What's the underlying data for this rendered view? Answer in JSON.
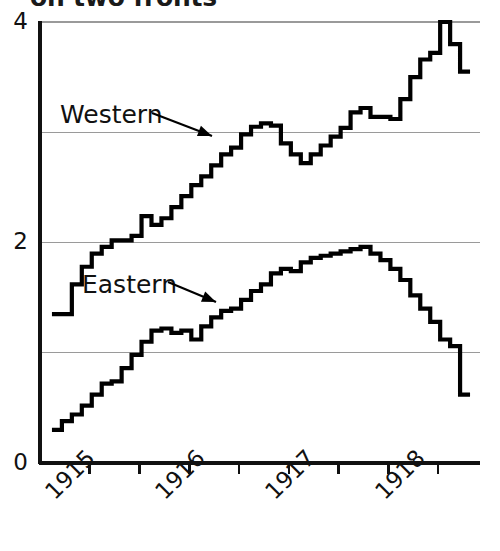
{
  "chart_data": {
    "type": "line",
    "title": "on two fronts",
    "subtitle": "",
    "xlabel": "",
    "ylabel": "",
    "xlim": [
      1914.5,
      1918.9
    ],
    "ylim": [
      0,
      4
    ],
    "grid": true,
    "legend_position": "inline-annotations",
    "y_ticks": [
      0,
      2,
      4
    ],
    "y_gridlines": [
      0,
      1,
      2,
      3,
      4
    ],
    "y_tick_labels": [
      "0",
      "2",
      "4"
    ],
    "x_ticks": [
      1915.0,
      1915.5,
      1916.0,
      1916.5,
      1917.0,
      1917.5,
      1918.0,
      1918.5
    ],
    "x_tick_labels": [
      "1915",
      "",
      "1916",
      "",
      "1917",
      "",
      "1918",
      ""
    ],
    "x_labeled_years": [
      "1915",
      "1916",
      "1917",
      "1918"
    ],
    "line_style": "step",
    "series": [
      {
        "name": "Western",
        "color": "#000000",
        "x": [
          1914.62,
          1914.72,
          1914.82,
          1914.92,
          1915.02,
          1915.12,
          1915.22,
          1915.32,
          1915.42,
          1915.52,
          1915.62,
          1915.72,
          1915.82,
          1915.92,
          1916.02,
          1916.12,
          1916.22,
          1916.32,
          1916.42,
          1916.52,
          1916.62,
          1916.72,
          1916.82,
          1916.92,
          1917.02,
          1917.12,
          1917.22,
          1917.32,
          1917.42,
          1917.52,
          1917.62,
          1917.72,
          1917.82,
          1917.92,
          1918.02,
          1918.12,
          1918.22,
          1918.32,
          1918.42,
          1918.52,
          1918.62,
          1918.72
        ],
        "values": [
          1.35,
          1.35,
          1.62,
          1.78,
          1.9,
          1.96,
          2.02,
          2.02,
          2.06,
          2.24,
          2.16,
          2.22,
          2.32,
          2.42,
          2.52,
          2.6,
          2.7,
          2.8,
          2.86,
          2.98,
          3.05,
          3.08,
          3.06,
          2.9,
          2.8,
          2.72,
          2.8,
          2.88,
          2.96,
          3.04,
          3.18,
          3.22,
          3.14,
          3.14,
          3.12,
          3.3,
          3.5,
          3.66,
          3.72,
          4.0,
          3.8,
          3.55
        ]
      },
      {
        "name": "Eastern",
        "color": "#000000",
        "x": [
          1914.62,
          1914.72,
          1914.82,
          1914.92,
          1915.02,
          1915.12,
          1915.22,
          1915.32,
          1915.42,
          1915.52,
          1915.62,
          1915.72,
          1915.82,
          1915.92,
          1916.02,
          1916.12,
          1916.22,
          1916.32,
          1916.42,
          1916.52,
          1916.62,
          1916.72,
          1916.82,
          1916.92,
          1917.02,
          1917.12,
          1917.22,
          1917.32,
          1917.42,
          1917.52,
          1917.62,
          1917.72,
          1917.82,
          1917.92,
          1918.02,
          1918.12,
          1918.22,
          1918.32,
          1918.42,
          1918.52,
          1918.62,
          1918.72
        ],
        "values": [
          0.3,
          0.38,
          0.44,
          0.52,
          0.62,
          0.72,
          0.74,
          0.86,
          0.98,
          1.1,
          1.2,
          1.22,
          1.18,
          1.2,
          1.12,
          1.24,
          1.32,
          1.38,
          1.4,
          1.48,
          1.56,
          1.62,
          1.72,
          1.76,
          1.74,
          1.82,
          1.86,
          1.88,
          1.9,
          1.92,
          1.94,
          1.96,
          1.9,
          1.84,
          1.76,
          1.66,
          1.52,
          1.4,
          1.28,
          1.12,
          1.06,
          0.62
        ]
      }
    ],
    "annotations": [
      {
        "text": "Western",
        "label_x_px": 60,
        "label_y_px": 100,
        "arrow_from_px": [
          152,
          113
        ],
        "arrow_to_px": [
          212,
          136
        ]
      },
      {
        "text": "Eastern",
        "label_x_px": 82,
        "label_y_px": 270,
        "arrow_from_px": [
          168,
          282
        ],
        "arrow_to_px": [
          216,
          302
        ]
      }
    ]
  }
}
